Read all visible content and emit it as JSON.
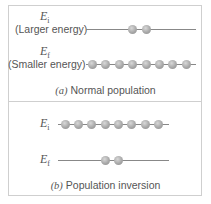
{
  "panels": [
    {
      "caption_letter": "(a)",
      "caption_text": "Normal population",
      "upper_level": {
        "symbol": "E",
        "subscript": "i",
        "label": "(Larger energy)",
        "atoms": 2
      },
      "lower_level": {
        "symbol": "E",
        "subscript": "f",
        "label": "(Smaller energy)",
        "atoms": 8
      }
    },
    {
      "caption_letter": "(b)",
      "caption_text": "Population inversion",
      "upper_level": {
        "symbol": "E",
        "subscript": "i",
        "atoms": 8
      },
      "lower_level": {
        "symbol": "E",
        "subscript": "f",
        "atoms": 2
      }
    }
  ],
  "colors": {
    "border": "#cfcfcf",
    "line": "#888888",
    "atom": "#a8a8a8"
  }
}
